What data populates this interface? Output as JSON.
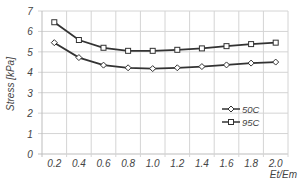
{
  "chart_data": {
    "type": "line",
    "title": "",
    "xlabel": "Et/Em",
    "ylabel": "Stress [kPa]",
    "categories": [
      "0.2",
      "0.4",
      "0.6",
      "0.8",
      "1.0",
      "1.2",
      "1.4",
      "1.6",
      "1.8",
      "2.0"
    ],
    "x": [
      0.2,
      0.4,
      0.6,
      0.8,
      1.0,
      1.2,
      1.4,
      1.6,
      1.8,
      2.0
    ],
    "series": [
      {
        "name": "50C",
        "marker": "diamond",
        "color": "#333333",
        "values": [
          5.45,
          4.72,
          4.35,
          4.22,
          4.18,
          4.22,
          4.28,
          4.36,
          4.45,
          4.5
        ]
      },
      {
        "name": "95C",
        "marker": "square",
        "color": "#333333",
        "values": [
          6.45,
          5.58,
          5.2,
          5.05,
          5.05,
          5.1,
          5.17,
          5.28,
          5.38,
          5.45
        ]
      }
    ],
    "ylim": [
      0,
      7
    ],
    "yticks": [
      0,
      1,
      2,
      3,
      4,
      5,
      6,
      7
    ],
    "grid": true,
    "legend_position": "right-center inside plot"
  },
  "colors": {
    "grid": "#d4d4d4",
    "axis": "#bdbdbd",
    "line": "#333333",
    "text": "#444444"
  }
}
